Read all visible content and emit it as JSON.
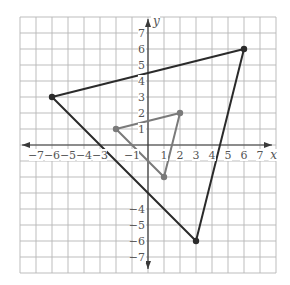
{
  "figure": {
    "type": "coordinate-plane",
    "axis_labels": {
      "x": "x",
      "y": "y"
    },
    "x_range": [
      -8,
      8
    ],
    "y_range": [
      -8,
      8
    ],
    "x_tick_labels": [
      -7,
      -6,
      -5,
      -4,
      -3,
      -1,
      1,
      2,
      3,
      4,
      5,
      6,
      7
    ],
    "y_tick_labels": [
      7,
      6,
      5,
      4,
      3,
      2,
      1,
      -4,
      -5,
      -6,
      -7
    ],
    "colors": {
      "grid": "#b5b5b5",
      "axis": "#3a3a3a",
      "large_triangle": "#2b2b2b",
      "small_triangle": "#7a7a7a",
      "labels": "#555555"
    },
    "shapes": [
      {
        "name": "large-triangle",
        "color_key": "large_triangle",
        "vertices": [
          [
            -6,
            3
          ],
          [
            6,
            6
          ],
          [
            3,
            -6
          ]
        ]
      },
      {
        "name": "small-triangle",
        "color_key": "small_triangle",
        "vertices": [
          [
            -2,
            1
          ],
          [
            2,
            2
          ],
          [
            1,
            -2
          ]
        ]
      }
    ]
  }
}
